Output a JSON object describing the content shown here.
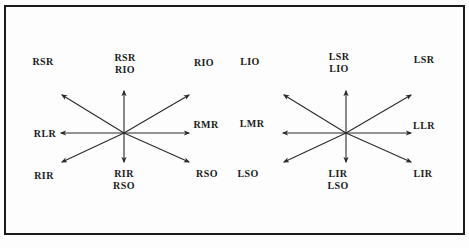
{
  "figure": {
    "colors": {
      "background": "#fdfdfd",
      "border": "#1b1b1b",
      "line": "#2a2a2a",
      "text": "#1b1b1b"
    },
    "rays": [
      {
        "name": "up",
        "dx": 0,
        "dy": -42
      },
      {
        "name": "down",
        "dx": 0,
        "dy": 29
      },
      {
        "name": "left",
        "dx": -63,
        "dy": 0
      },
      {
        "name": "right",
        "dx": 65,
        "dy": 0
      },
      {
        "name": "up-left",
        "dx": -62,
        "dy": -38
      },
      {
        "name": "up-right",
        "dx": 65,
        "dy": -38
      },
      {
        "name": "down-left",
        "dx": -62,
        "dy": 29
      },
      {
        "name": "down-right",
        "dx": 65,
        "dy": 29
      }
    ],
    "panels": [
      {
        "id": "right-eye",
        "center": {
          "x": 124,
          "y": 133
        },
        "labels": [
          {
            "position": "top-left",
            "lines": [
              "RSR"
            ]
          },
          {
            "position": "top-center",
            "lines": [
              "RSR",
              "RIO"
            ]
          },
          {
            "position": "top-right",
            "lines": [
              "RIO"
            ]
          },
          {
            "position": "left",
            "lines": [
              "RLR"
            ]
          },
          {
            "position": "right",
            "lines": [
              "RMR"
            ]
          },
          {
            "position": "bottom-left",
            "lines": [
              "RIR"
            ]
          },
          {
            "position": "bottom-center",
            "lines": [
              "RIR",
              "RSO"
            ]
          },
          {
            "position": "bottom-right",
            "lines": [
              "RSO"
            ]
          }
        ]
      },
      {
        "id": "left-eye",
        "center": {
          "x": 346,
          "y": 133
        },
        "labels": [
          {
            "position": "top-left",
            "lines": [
              "LIO"
            ]
          },
          {
            "position": "top-center",
            "lines": [
              "LSR",
              "LIO"
            ]
          },
          {
            "position": "top-right",
            "lines": [
              "LSR"
            ]
          },
          {
            "position": "left",
            "lines": [
              "LMR"
            ]
          },
          {
            "position": "right",
            "lines": [
              "LLR"
            ]
          },
          {
            "position": "bottom-left",
            "lines": [
              "LSO"
            ]
          },
          {
            "position": "bottom-center",
            "lines": [
              "LIR",
              "LSO"
            ]
          },
          {
            "position": "bottom-right",
            "lines": [
              "LIR"
            ]
          }
        ]
      }
    ]
  }
}
